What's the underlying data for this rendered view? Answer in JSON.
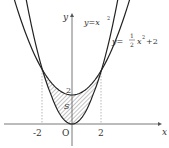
{
  "diagram": {
    "type": "region-between-curves",
    "curves": [
      {
        "name": "lower",
        "equation_prefix": "y=x",
        "exponent": "2",
        "coeffs": {
          "a": 1,
          "c": 0
        }
      },
      {
        "name": "upper",
        "equation_prefix": "y=",
        "frac_num": "1",
        "frac_den": "2",
        "after_frac": "x",
        "exponent": "2",
        "suffix": "+2",
        "coeffs": {
          "a": 0.5,
          "c": 2
        }
      }
    ],
    "intersections_x": [
      -2,
      2
    ],
    "region_label": "S",
    "axis": {
      "x_label": "x",
      "y_label": "y",
      "origin_label": "O",
      "x_ticks": [
        "-2",
        "2"
      ],
      "x_tick_values": [
        -2,
        2
      ],
      "y_ticks": [
        "2"
      ],
      "y_tick_values": [
        2
      ]
    },
    "colors": {
      "curve": "#222222",
      "axis": "#555555",
      "hatch": "#777777",
      "dash": "#999999"
    }
  }
}
